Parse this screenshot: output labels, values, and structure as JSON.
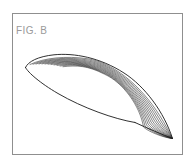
{
  "figure": {
    "label": "FIG. B",
    "label_color": "#9a9a9a",
    "frame_color": "#8f8f8f",
    "background_color": "#ffffff",
    "line_color": "#1a1a1a",
    "hatch_line_count": 12
  },
  "geometry": {
    "leading_edge": [
      25,
      67
    ],
    "upper_apex": [
      88,
      55
    ],
    "trailing_tip": [
      172,
      138
    ],
    "lower_vertex": [
      135,
      122
    ]
  }
}
